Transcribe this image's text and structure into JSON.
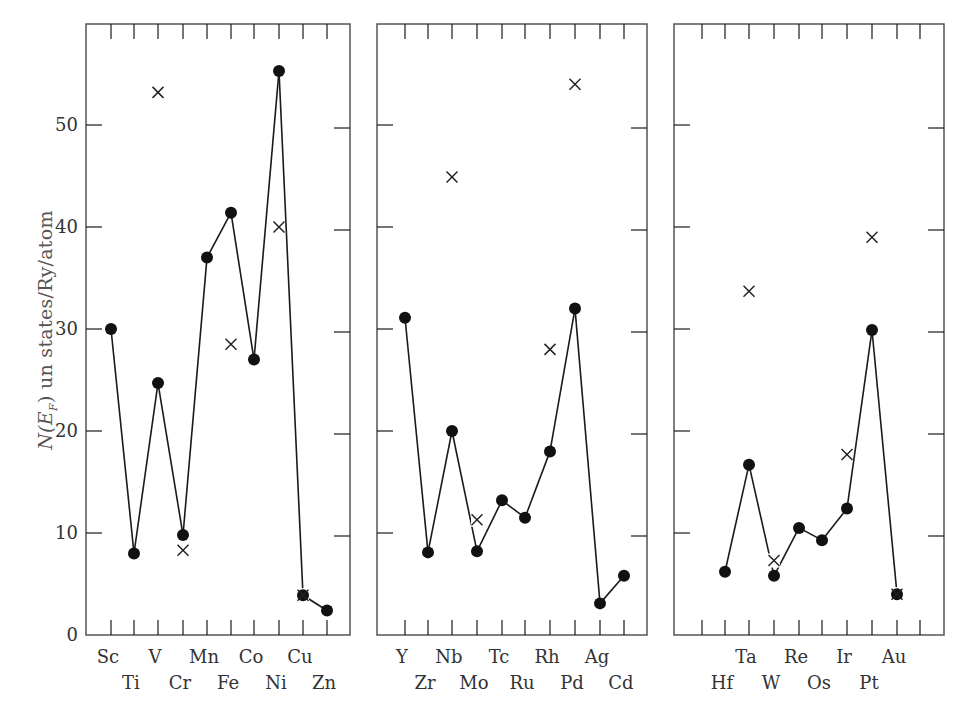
{
  "chart_data": {
    "type": "line",
    "title": "",
    "ylabel": "N(E_F) un states/Ry/atom",
    "ylabel_parts": {
      "n": "N(",
      "e": "E",
      "sub": "F",
      "rest": ")  un states/Ry/atom"
    },
    "ylim": [
      0,
      60
    ],
    "yticks": [
      0,
      10,
      20,
      30,
      40,
      50
    ],
    "grid": false,
    "legend": "none",
    "markers": {
      "filled_circle": "calculated (connected by line)",
      "cross": "experimental / alternate estimate"
    },
    "panels": [
      {
        "name": "3d transition metals",
        "elements": [
          "Sc",
          "Ti",
          "V",
          "Cr",
          "Mn",
          "Fe",
          "Co",
          "Ni",
          "Cu",
          "Zn"
        ],
        "label_row1": [
          "Sc",
          "V",
          "Mn",
          "Co",
          "Cu"
        ],
        "label_row2": [
          "Ti",
          "Cr",
          "Fe",
          "Ni",
          "Zn"
        ],
        "circles": [
          30.0,
          8.0,
          24.7,
          9.8,
          37.0,
          41.4,
          27.0,
          55.3,
          3.9,
          2.4
        ],
        "crosses": [
          null,
          null,
          53.2,
          8.3,
          null,
          28.5,
          null,
          40.0,
          3.9,
          null
        ]
      },
      {
        "name": "4d transition metals",
        "elements": [
          "Y",
          "Zr",
          "Nb",
          "Mo",
          "Tc",
          "Ru",
          "Rh",
          "Pd",
          "Ag",
          "Cd"
        ],
        "label_row1": [
          "Y",
          "Nb",
          "Tc",
          "Rh",
          "Ag"
        ],
        "label_row2": [
          "Zr",
          "Mo",
          "Ru",
          "Pd",
          "Cd"
        ],
        "circles": [
          31.1,
          8.1,
          20.0,
          8.2,
          13.2,
          11.5,
          18.0,
          32.0,
          3.1,
          5.8
        ],
        "crosses": [
          null,
          null,
          44.9,
          11.3,
          null,
          null,
          28.0,
          54.0,
          null,
          null
        ]
      },
      {
        "name": "5d transition metals",
        "elements": [
          "",
          "Hf",
          "Ta",
          "W",
          "Re",
          "Os",
          "Ir",
          "Pt",
          "Au",
          ""
        ],
        "label_row1": [
          "Ta",
          "Re",
          "Ir",
          "Au"
        ],
        "label_row2": [
          "Hf",
          "W",
          "Os",
          "Pt"
        ],
        "circles": [
          null,
          6.2,
          16.7,
          5.8,
          10.5,
          9.3,
          12.4,
          29.9,
          4.0,
          null
        ],
        "crosses": [
          null,
          null,
          33.7,
          7.3,
          null,
          null,
          17.7,
          39.0,
          4.0,
          null
        ]
      }
    ]
  },
  "axis_labels": {
    "y0": "0",
    "y10": "10",
    "y20": "20",
    "y30": "30",
    "y40": "40",
    "y50": "50"
  },
  "colors": {
    "line": "#1a1a1a",
    "frame": "#555555",
    "text": "#333333"
  }
}
